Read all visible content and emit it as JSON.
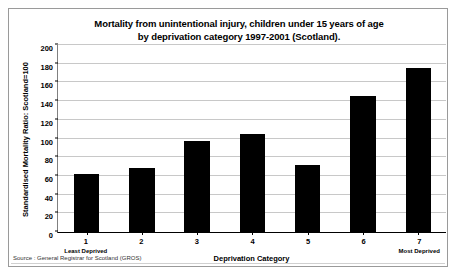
{
  "chart_data": {
    "type": "bar",
    "title": "Mortality from unintentional injury, children under 15 years of age by deprivation category 1997-2001 (Scotland).",
    "title_line1": "Mortality from unintentional injury, children under 15 years of age",
    "title_line2": "by deprivation category 1997-2001 (Scotland).",
    "categories": [
      "1",
      "2",
      "3",
      "4",
      "5",
      "6",
      "7"
    ],
    "values": [
      62,
      68,
      97,
      105,
      72,
      145,
      175
    ],
    "xlabel": "Deprivation Category",
    "ylabel": "Standardised Mortality Ratio: Scotland=100",
    "ylim": [
      0,
      200
    ],
    "ytick_step": 20,
    "yticks": [
      "200",
      "180",
      "160",
      "140",
      "120",
      "100",
      "80",
      "60",
      "40",
      "20",
      "0"
    ],
    "grid": true,
    "legend": "none",
    "bar_color": "#000000",
    "category_annotations": {
      "first": "Least Deprived",
      "last": "Most Deprived"
    },
    "source_note": "Source : General Registrar for Scotland (GROS)"
  }
}
